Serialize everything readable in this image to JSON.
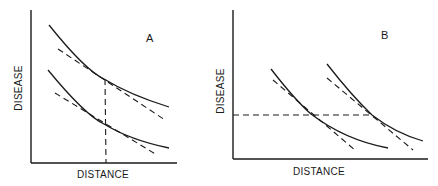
{
  "panels": [
    {
      "id": "A",
      "label": "A",
      "xlabel": "DISTANCE",
      "ylabel": "DISEASE",
      "description": "Two parallel decreasing curves with dashed tangents at the same distance; vertical dashed line marks common distance"
    },
    {
      "id": "B",
      "label": "B",
      "xlabel": "DISTANCE",
      "ylabel": "DISEASE",
      "description": "Two horizontally shifted decreasing curves with dashed tangents at the same disease level; horizontal dashed line marks common disease level"
    }
  ],
  "colors": {
    "ink": "#1a1a1a",
    "background": "#ffffff"
  }
}
